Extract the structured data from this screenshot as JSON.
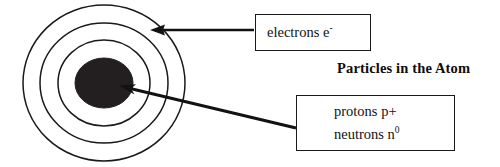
{
  "figure": {
    "title": "Particles in the Atom",
    "background_color": "#ffffff",
    "stroke_color": "#1a1a1a",
    "nucleus_color": "#231f20"
  },
  "atom": {
    "center": {
      "x": 104,
      "y": 83
    },
    "nucleus": {
      "rx": 29,
      "ry": 25,
      "label": "nucleus"
    },
    "shells": [
      {
        "name": "inner-shell",
        "rx": 46,
        "ry": 43
      },
      {
        "name": "middle-shell",
        "rx": 64,
        "ry": 60
      },
      {
        "name": "outer-shell",
        "rx": 81,
        "ry": 78
      }
    ]
  },
  "callouts": {
    "electrons": {
      "name": "electrons-callout",
      "lines": [
        {
          "text": "electrons e",
          "sup": "-"
        }
      ],
      "text_plain": "electrons e-"
    },
    "nucleus_particles": {
      "name": "nucleus-callout",
      "lines": [
        {
          "text": "protons p+",
          "sup": ""
        },
        {
          "text": "neutrons n",
          "sup": "0"
        }
      ],
      "text_plain": "protons p+ neutrons n0"
    }
  },
  "arrows": [
    {
      "name": "electrons-arrow",
      "from": {
        "x": 254,
        "y": 30
      },
      "to": {
        "x": 152,
        "y": 30
      },
      "points_to": "outer-shell"
    },
    {
      "name": "nucleus-arrow",
      "from": {
        "x": 296,
        "y": 128
      },
      "to": {
        "x": 120,
        "y": 86
      },
      "points_to": "nucleus"
    }
  ]
}
